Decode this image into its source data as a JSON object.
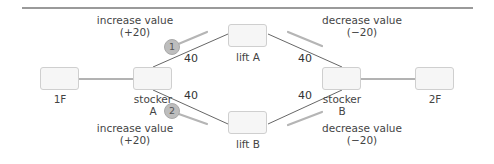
{
  "diagram": {
    "nodes": [
      {
        "id": "1F",
        "label": "1F"
      },
      {
        "id": "stockerA",
        "label_line1": "stocker",
        "label_line2": "A"
      },
      {
        "id": "liftA",
        "label": "lift A"
      },
      {
        "id": "liftB",
        "label": "lift B"
      },
      {
        "id": "stockerB",
        "label_line1": "stocker",
        "label_line2": "B"
      },
      {
        "id": "2F",
        "label": "2F"
      }
    ],
    "edges": [
      {
        "from": "1F",
        "to": "stockerA",
        "weight": ""
      },
      {
        "from": "stockerA",
        "to": "liftA",
        "weight": "40"
      },
      {
        "from": "liftA",
        "to": "stockerB",
        "weight": "40"
      },
      {
        "from": "stockerA",
        "to": "liftB",
        "weight": "40"
      },
      {
        "from": "liftB",
        "to": "stockerB",
        "weight": "40"
      },
      {
        "from": "stockerB",
        "to": "2F",
        "weight": ""
      }
    ],
    "annotations": {
      "top_left": {
        "line1": "increase value",
        "line2": "(+20)"
      },
      "top_right": {
        "line1": "decrease value",
        "line2": "(−20)"
      },
      "bottom_left": {
        "line1": "increase value",
        "line2": "(+20)"
      },
      "bottom_right": {
        "line1": "decrease value",
        "line2": "(−20)"
      }
    },
    "badges": [
      {
        "label": "1"
      },
      {
        "label": "2"
      }
    ],
    "colors": {
      "line": "#555555",
      "arrow": "#b5b5b5",
      "box_border": "#cfcfcf",
      "box_fill": "#f6f6f6",
      "badge_fill": "#bdbdbd",
      "rule": "#9a9a9a"
    }
  }
}
